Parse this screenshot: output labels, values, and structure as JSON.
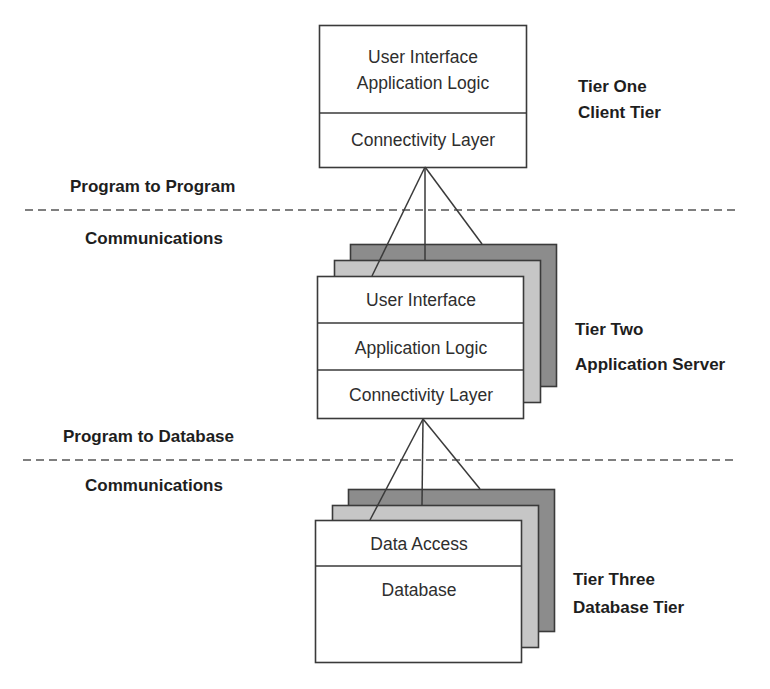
{
  "diagram": {
    "type": "three-tier-architecture",
    "colors": {
      "box_fill": "#ffffff",
      "stack_light": "#c6c6c6",
      "stack_dark": "#8c8c8c",
      "stroke": "#3a3a3a"
    },
    "tiers": [
      {
        "id": "tier-one",
        "label_line1": "Tier One",
        "label_line2": "Client Tier",
        "layers": [
          "User Interface",
          "Application Logic",
          "Connectivity Layer"
        ]
      },
      {
        "id": "tier-two",
        "label_line1": "Tier Two",
        "label_line2": "Application Server",
        "layers": [
          "User Interface",
          "Application Logic",
          "Connectivity Layer"
        ]
      },
      {
        "id": "tier-three",
        "label_line1": "Tier Three",
        "label_line2": "Database Tier",
        "layers": [
          "Data Access",
          "Database"
        ]
      }
    ],
    "boundaries": [
      {
        "id": "program-to-program",
        "label_above": "Program to Program",
        "label_below": "Communications"
      },
      {
        "id": "program-to-database",
        "label_above": "Program to Database",
        "label_below": "Communications"
      }
    ]
  }
}
